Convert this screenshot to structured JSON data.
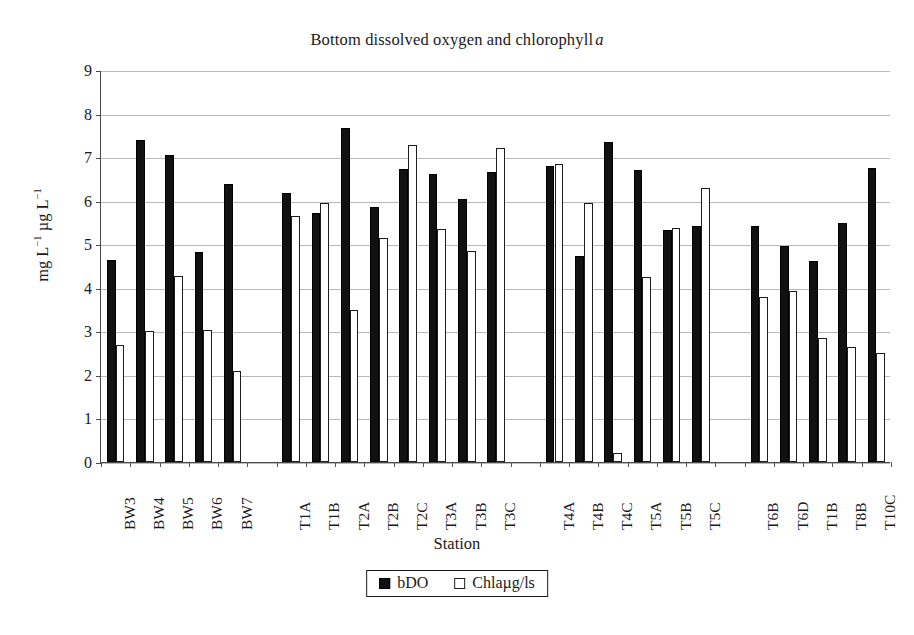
{
  "chart_data": {
    "type": "bar",
    "title_prefix": "Bottom dissolved oxygen and chlorophyll",
    "title_italic_suffix": "a",
    "xlabel": "Station",
    "ylabel": "mg L⁻¹ µg L⁻¹",
    "ylabel_parts": {
      "p1": "mg L",
      "e1": "−1",
      "p2": " µg L",
      "e2": "−1"
    },
    "ylim": [
      0,
      9
    ],
    "ytick_labels": [
      "0",
      "1",
      "2",
      "3",
      "4",
      "5",
      "6",
      "7",
      "8",
      "9"
    ],
    "yticks": [
      0,
      1,
      2,
      3,
      4,
      5,
      6,
      7,
      8,
      9
    ],
    "grid": true,
    "grid_axis": "y",
    "legend_position": "bottom-center",
    "categories": [
      "BW3",
      "BW4",
      "BW5",
      "BW6",
      "BW7",
      "T1A",
      "T1B",
      "T2A",
      "T2B",
      "T2C",
      "T3A",
      "T3B",
      "T3C",
      "T4A",
      "T4B",
      "T4C",
      "T5A",
      "T5B",
      "T5C",
      "T6B",
      "T6D",
      "T1B",
      "T8B",
      "T10C"
    ],
    "group_breaks_after": [
      "BW7",
      "T3C",
      "T5C"
    ],
    "series": [
      {
        "name": "bDO",
        "style": "filled",
        "color": "#111111",
        "values": [
          4.63,
          7.4,
          7.05,
          4.82,
          6.38,
          6.18,
          5.72,
          7.68,
          5.85,
          6.72,
          6.62,
          6.05,
          6.67,
          6.8,
          4.72,
          7.35,
          6.7,
          5.32,
          5.43,
          5.42,
          4.95,
          4.62,
          5.48,
          6.75
        ]
      },
      {
        "name": "Chlaµg/ls",
        "style": "hollow",
        "color": "#ffffff",
        "values": [
          2.68,
          3.0,
          4.28,
          3.03,
          2.08,
          5.65,
          5.95,
          3.5,
          5.15,
          7.28,
          5.35,
          4.85,
          7.2,
          6.85,
          5.95,
          0.2,
          4.25,
          5.38,
          6.28,
          3.78,
          3.92,
          2.85,
          2.65,
          2.5
        ]
      }
    ]
  },
  "legend": {
    "entries": [
      {
        "label": "bDO",
        "swatch": "filled-square-icon"
      },
      {
        "label": "Chlaµg/ls",
        "swatch": "hollow-square-icon"
      }
    ]
  }
}
